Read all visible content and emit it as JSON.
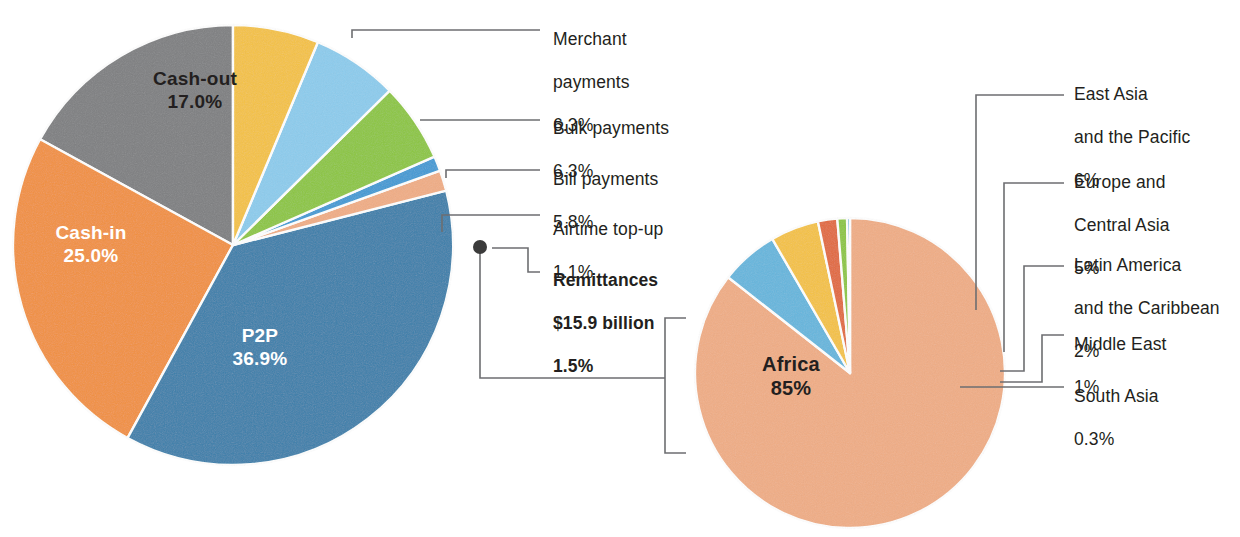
{
  "figure": {
    "background": "#ffffff",
    "dot_marker_color": "#3b3b3b",
    "connector_color": "#6d6e71"
  },
  "chart_data": [
    {
      "type": "pie",
      "name": "mobile-money-transaction-mix",
      "title": "",
      "start_angle_deg": -90,
      "direction": "counterclockwise",
      "center": [
        233,
        245
      ],
      "radius": 220,
      "categories": [
        "Cash-out",
        "Cash-in",
        "P2P",
        "Remittances",
        "Airtime top-up",
        "Bill payments",
        "Bulk payments",
        "Merchant payments"
      ],
      "values": [
        17.0,
        25.0,
        36.9,
        1.5,
        1.1,
        5.8,
        6.3,
        6.3
      ],
      "value_labels": [
        "17.0%",
        "25.0%",
        "36.9%",
        "1.5%",
        "1.1%",
        "5.8%",
        "6.3%",
        "6.3%"
      ],
      "colors": [
        "#7e7f81",
        "#f2903e",
        "#3a7fab",
        "#f0ad85",
        "#3f9ad4",
        "#8cc63f",
        "#8ccced",
        "#f5c242"
      ],
      "slices": [
        {
          "label": "Cash-out",
          "value": 17.0,
          "value_label": "17.0%",
          "color": "#7e7f81",
          "label_position": "inside",
          "label_color": "#231f20"
        },
        {
          "label": "Cash-in",
          "value": 25.0,
          "value_label": "25.0%",
          "color": "#f2903e",
          "label_position": "inside",
          "label_color": "#ffffff"
        },
        {
          "label": "P2P",
          "value": 36.9,
          "value_label": "36.9%",
          "color": "#3a7fab",
          "label_position": "inside",
          "label_color": "#ffffff"
        },
        {
          "label": "Remittances",
          "value": 1.5,
          "value_label": "1.5%",
          "extra": "$15.9 billion",
          "color": "#f0ad85",
          "label_position": "callout",
          "emphasis": "bold"
        },
        {
          "label": "Airtime top-up",
          "value": 1.1,
          "value_label": "1.1%",
          "color": "#3f9ad4",
          "label_position": "callout"
        },
        {
          "label": "Bill payments",
          "value": 5.8,
          "value_label": "5.8%",
          "color": "#8cc63f",
          "label_position": "callout"
        },
        {
          "label": "Bulk payments",
          "value": 6.3,
          "value_label": "6.3%",
          "color": "#8ccced",
          "label_position": "callout"
        },
        {
          "label": "Merchant payments",
          "value": 6.3,
          "value_label": "6.3%",
          "color": "#f5c242",
          "label_position": "callout"
        }
      ],
      "inside_labels": [
        {
          "text": "Cash-out",
          "value": "17.0%"
        },
        {
          "text": "Cash-in",
          "value": "25.0%"
        },
        {
          "text": "P2P",
          "value": "36.9%"
        }
      ]
    },
    {
      "type": "pie",
      "name": "remittances-by-region",
      "title": "",
      "start_angle_deg": -90,
      "direction": "clockwise",
      "center": [
        850,
        373
      ],
      "radius": 155,
      "categories": [
        "Africa",
        "East Asia and the Pacific",
        "Europe and Central Asia",
        "Latin America and the Caribbean",
        "Middle East",
        "South Asia"
      ],
      "values": [
        85,
        6,
        5,
        2,
        1,
        0.3
      ],
      "value_labels": [
        "85%",
        "6%",
        "5%",
        "2%",
        "1%",
        "0.3%"
      ],
      "colors": [
        "#f0ad85",
        "#65b6dd",
        "#f5c242",
        "#e2693c",
        "#8cc63f",
        "#3f9ad4"
      ],
      "slices": [
        {
          "label": "Africa",
          "value": 85,
          "value_label": "85%",
          "color": "#f0ad85",
          "label_position": "inside",
          "label_color": "#231f20"
        },
        {
          "label": "East Asia and the Pacific",
          "value": 6,
          "value_label": "6%",
          "color": "#65b6dd",
          "label_position": "callout"
        },
        {
          "label": "Europe and Central Asia",
          "value": 5,
          "value_label": "5%",
          "color": "#f5c242",
          "label_position": "callout"
        },
        {
          "label": "Latin America and the Caribbean",
          "value": 2,
          "value_label": "2%",
          "color": "#e2693c",
          "label_position": "callout"
        },
        {
          "label": "Middle East",
          "value": 1,
          "value_label": "1%",
          "color": "#8cc63f",
          "label_position": "callout"
        },
        {
          "label": "South Asia",
          "value": 0.3,
          "value_label": "0.3%",
          "color": "#3f9ad4",
          "label_position": "callout"
        }
      ],
      "inside_labels": [
        {
          "text": "Africa",
          "value": "85%"
        }
      ]
    }
  ],
  "left_pie": {
    "inside": {
      "cash_out_name": "Cash-out",
      "cash_out_value": "17.0%",
      "cash_in_name": "Cash-in",
      "cash_in_value": "25.0%",
      "p2p_name": "P2P",
      "p2p_value": "36.9%"
    },
    "callouts": [
      {
        "name": "Merchant payments",
        "line1": "Merchant",
        "line2": "payments",
        "value": "6.3%",
        "bold": false
      },
      {
        "name": "Bulk payments",
        "line1": "Bulk payments",
        "line2": "",
        "value": "6.3%",
        "bold": false
      },
      {
        "name": "Bill payments",
        "line1": "Bill payments",
        "line2": "",
        "value": "5.8%",
        "bold": false
      },
      {
        "name": "Airtime top-up",
        "line1": "Airtime top-up",
        "line2": "",
        "value": "1.1%",
        "bold": false
      },
      {
        "name": "Remittances",
        "line1": "Remittances",
        "line2": "$15.9 billion",
        "value": "1.5%",
        "bold": true
      }
    ]
  },
  "right_pie": {
    "inside": {
      "africa_name": "Africa",
      "africa_value": "85%"
    },
    "callouts": [
      {
        "name": "East Asia and the Pacific",
        "line1": "East Asia",
        "line2": "and the Pacific",
        "value": "6%"
      },
      {
        "name": "Europe and Central Asia",
        "line1": "Europe and",
        "line2": "Central Asia",
        "value": "5%"
      },
      {
        "name": "Latin America and the Caribbean",
        "line1": "Latin America",
        "line2": "and the Caribbean",
        "value": "2%"
      },
      {
        "name": "Middle East",
        "line1": "Middle East",
        "line2": "",
        "value": "1%"
      },
      {
        "name": "South Asia",
        "line1": "South Asia",
        "line2": "",
        "value": "0.3%"
      }
    ]
  }
}
